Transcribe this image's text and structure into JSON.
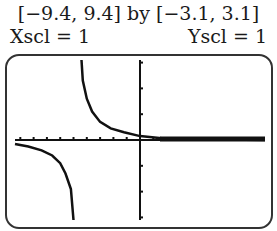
{
  "header": {
    "window_text": "[−9.4, 9.4] by [−3.1, 3.1]",
    "xscl_text": "Xscl = 1",
    "yscl_text": "Yscl = 1"
  },
  "chart_data": {
    "type": "line",
    "title": "[−9.4, 9.4] by [−3.1, 3.1]",
    "xlabel": "",
    "ylabel": "",
    "xlim": [
      -9.4,
      9.4
    ],
    "ylim": [
      -3.1,
      3.1
    ],
    "xscl": 1,
    "yscl": 1,
    "grid": false,
    "legend": null,
    "annotations": [
      "Xscl = 1",
      "Yscl = 1"
    ],
    "vertical_asymptote_x": -4.6,
    "horizontal_asymptote_y": 0,
    "series": [
      {
        "name": "upper branch (x > asymptote)",
        "points": [
          [
            -4.4,
            3.1
          ],
          [
            -4.3,
            2.3
          ],
          [
            -4.0,
            1.6
          ],
          [
            -3.6,
            1.1
          ],
          [
            -3.0,
            0.7
          ],
          [
            -2.2,
            0.45
          ],
          [
            -1.2,
            0.3
          ],
          [
            0,
            0.15
          ],
          [
            2,
            0.05
          ],
          [
            9.4,
            0.0
          ]
        ]
      },
      {
        "name": "lower branch (x < asymptote)",
        "points": [
          [
            -9.4,
            -0.15
          ],
          [
            -8.4,
            -0.25
          ],
          [
            -7.4,
            -0.4
          ],
          [
            -6.6,
            -0.6
          ],
          [
            -6.0,
            -0.9
          ],
          [
            -5.6,
            -1.3
          ],
          [
            -5.2,
            -1.9
          ],
          [
            -5.0,
            -3.1
          ]
        ]
      }
    ]
  }
}
